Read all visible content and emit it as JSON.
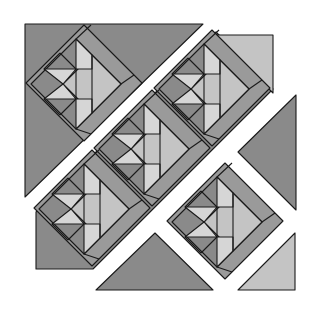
{
  "diagram": {
    "title": "Quilt block layout — fish blocks on point",
    "type": "quilt-pattern",
    "colors": {
      "background": "#ffffff",
      "dark_fabric": "#8a8a8a",
      "border_fabric": "#9a9a9a",
      "light_fabric": "#c4c4c4",
      "lightest_fabric": "#d6d6d6",
      "seam_line": "#1a1a1a"
    },
    "block_count": 5,
    "block_motif": "fish",
    "setting_pieces": [
      "top-left corner triangle",
      "top-right light triangle",
      "right setting triangle",
      "bottom setting triangle",
      "bottom-right light triangle"
    ]
  }
}
